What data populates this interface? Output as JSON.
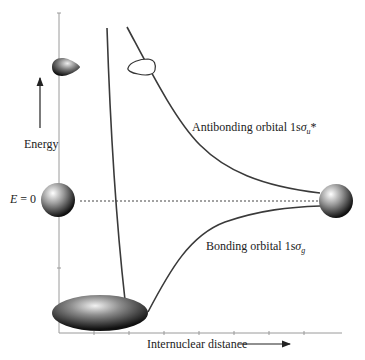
{
  "diagram": {
    "title": "",
    "y_axis": {
      "label": "Energy",
      "zero_label": "E = 0",
      "zero_var": "E",
      "zero_value": "= 0"
    },
    "x_axis": {
      "label": "Internuclear distance"
    },
    "curves": [
      {
        "name": "Antibonding orbital",
        "prefix": "Antibonding orbital 1s",
        "symbol": "σ",
        "subscript": "u",
        "suffix": "*"
      },
      {
        "name": "Bonding orbital",
        "prefix": "Bonding orbital 1s",
        "symbol": "σ",
        "subscript": "g",
        "suffix": ""
      }
    ],
    "colors": {
      "curve": "#3a3a3a",
      "axis": "#9a9a9a",
      "dashed": "#444444",
      "orbital_dark": "#1a1a1a",
      "orbital_light": "#f5f5f5"
    },
    "orbitals": [
      {
        "name": "antibonding-lobe-filled",
        "type": "teardrop"
      },
      {
        "name": "antibonding-lobe-outline",
        "type": "teardrop-outline"
      },
      {
        "name": "atom-left",
        "type": "sphere"
      },
      {
        "name": "atom-right",
        "type": "sphere"
      },
      {
        "name": "bonding-ellipsoid",
        "type": "ellipsoid"
      }
    ]
  }
}
